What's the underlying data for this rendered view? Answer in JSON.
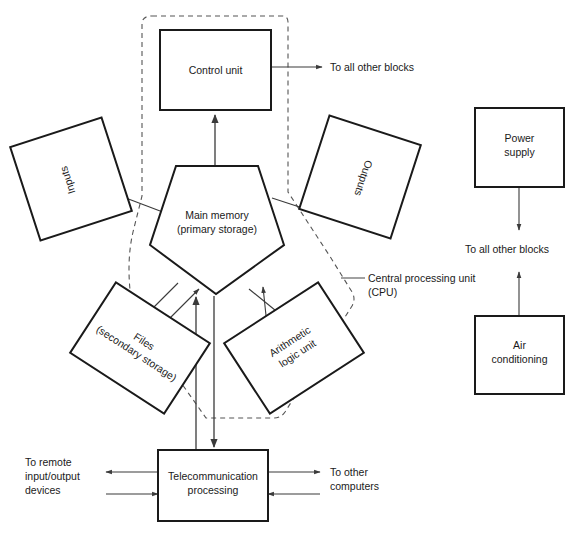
{
  "diagram": {
    "blocks": {
      "control_unit": {
        "label": "Control unit"
      },
      "main_memory": {
        "line1": "Main memory",
        "line2": "(primary storage)"
      },
      "inputs": {
        "label": "Inputs"
      },
      "outputs": {
        "label": "Outputs"
      },
      "files": {
        "line1": "Files",
        "line2": "(secondary storage)"
      },
      "alu": {
        "line1": "Arithmetic",
        "line2": "logic unit"
      },
      "telecom": {
        "line1": "Telecommunication",
        "line2": "processing"
      },
      "power_supply": {
        "line1": "Power",
        "line2": "supply"
      },
      "air_conditioning": {
        "line1": "Air",
        "line2": "conditioning"
      }
    },
    "annotations": {
      "cpu_boundary": {
        "line1": "Central processing unit",
        "line2": "(CPU)"
      },
      "control_unit_out": "To all other blocks",
      "power_out": "To all other blocks",
      "remote_io": {
        "line1": "To remote",
        "line2": "input/output",
        "line3": "devices"
      },
      "other_computers": {
        "line1": "To other",
        "line2": "computers"
      }
    },
    "colors": {
      "block_stroke": "#1a1a1a",
      "connector": "#3a3a3a",
      "dashed_boundary": "#555555",
      "background": "#ffffff",
      "text": "#1a1a1a"
    }
  }
}
